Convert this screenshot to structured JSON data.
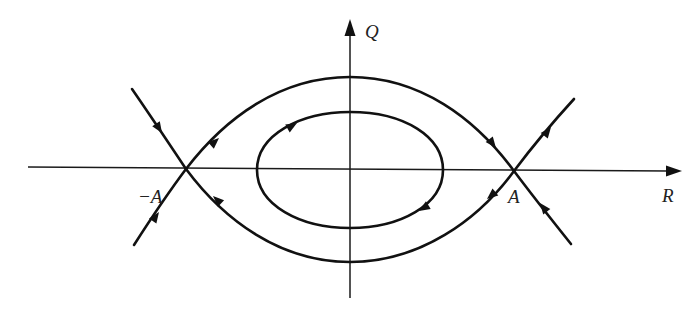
{
  "figure": {
    "type": "phase-portrait",
    "axes": {
      "x_label": "R",
      "y_label": "Q"
    },
    "points": {
      "left_saddle_label": "−A",
      "right_saddle_label": "A"
    },
    "colors": {
      "ink": "#111111",
      "background": "#ffffff"
    },
    "trajectories": [
      {
        "name": "upper-separatrix",
        "from": "−A",
        "to": "A",
        "direction": "left-to-right over top"
      },
      {
        "name": "lower-separatrix",
        "from": "A",
        "to": "−A",
        "direction": "right-to-left under bottom"
      },
      {
        "name": "closed-orbit",
        "direction": "clockwise"
      },
      {
        "name": "incoming-upper-left",
        "to": "−A"
      },
      {
        "name": "incoming-lower-left",
        "to": "−A"
      },
      {
        "name": "outgoing-upper-right",
        "from": "A"
      },
      {
        "name": "incoming-lower-right",
        "to": "A"
      }
    ]
  }
}
